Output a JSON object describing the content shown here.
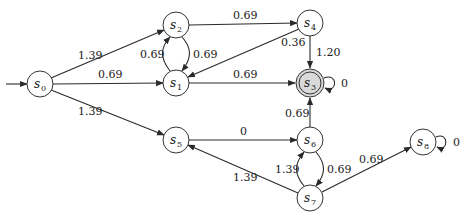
{
  "diagram": {
    "type": "weighted-automaton",
    "colors": {
      "edge": "#2a2a2a",
      "node_fill": "#ffffff",
      "final_fill": "#d9d9d9"
    },
    "initial_state": "s0",
    "final_states": [
      "s3"
    ],
    "nodes": [
      {
        "id": "s0",
        "name": "s",
        "sub": "0",
        "x": 40,
        "y": 84
      },
      {
        "id": "s1",
        "name": "s",
        "sub": "1",
        "x": 176,
        "y": 83
      },
      {
        "id": "s2",
        "name": "s",
        "sub": "2",
        "x": 176,
        "y": 25
      },
      {
        "id": "s3",
        "name": "s",
        "sub": "3",
        "x": 310,
        "y": 83
      },
      {
        "id": "s4",
        "name": "s",
        "sub": "4",
        "x": 310,
        "y": 23
      },
      {
        "id": "s5",
        "name": "s",
        "sub": "5",
        "x": 176,
        "y": 140
      },
      {
        "id": "s6",
        "name": "s",
        "sub": "6",
        "x": 310,
        "y": 140
      },
      {
        "id": "s7",
        "name": "s",
        "sub": "7",
        "x": 310,
        "y": 198
      },
      {
        "id": "s8",
        "name": "s",
        "sub": "8",
        "x": 423,
        "y": 142
      }
    ],
    "edges": [
      {
        "from": "s0",
        "to": "s2",
        "weight": "1.39"
      },
      {
        "from": "s0",
        "to": "s1",
        "weight": "0.69"
      },
      {
        "from": "s0",
        "to": "s5",
        "weight": "1.39"
      },
      {
        "from": "s1",
        "to": "s2",
        "weight": "0.69"
      },
      {
        "from": "s2",
        "to": "s1",
        "weight": "0.69"
      },
      {
        "from": "s2",
        "to": "s4",
        "weight": "0.69"
      },
      {
        "from": "s4",
        "to": "s1",
        "weight": "0.36"
      },
      {
        "from": "s1",
        "to": "s3",
        "weight": "0.69"
      },
      {
        "from": "s4",
        "to": "s3",
        "weight": "1.20"
      },
      {
        "from": "s3",
        "to": "s3",
        "weight": "0"
      },
      {
        "from": "s6",
        "to": "s3",
        "weight": "0.69"
      },
      {
        "from": "s5",
        "to": "s6",
        "weight": "0"
      },
      {
        "from": "s7",
        "to": "s6",
        "weight": "1.39"
      },
      {
        "from": "s6",
        "to": "s7",
        "weight": "0.69"
      },
      {
        "from": "s7",
        "to": "s5",
        "weight": "1.39"
      },
      {
        "from": "s7",
        "to": "s8",
        "weight": "0.69"
      },
      {
        "from": "s8",
        "to": "s8",
        "weight": "0"
      }
    ]
  }
}
